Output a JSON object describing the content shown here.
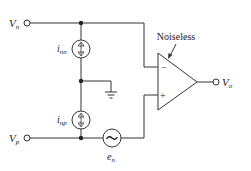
{
  "diagram": {
    "type": "op-amp noise model circuit",
    "terminals": {
      "vn": {
        "label": "V",
        "sub": "n"
      },
      "vp": {
        "label": "V",
        "sub": "p"
      },
      "vo": {
        "label": "V",
        "sub": "o"
      }
    },
    "sources": {
      "inn": {
        "label": "i",
        "sub": "nn",
        "kind": "current-source"
      },
      "inp": {
        "label": "i",
        "sub": "np",
        "kind": "current-source"
      },
      "en": {
        "label": "e",
        "sub": "n",
        "kind": "voltage-source",
        "symbol": "~"
      }
    },
    "opamp": {
      "annotation": "Noiseless",
      "minus": "−",
      "plus": "+"
    },
    "colors": {
      "stroke": "#333333",
      "background": "#ffffff"
    }
  }
}
